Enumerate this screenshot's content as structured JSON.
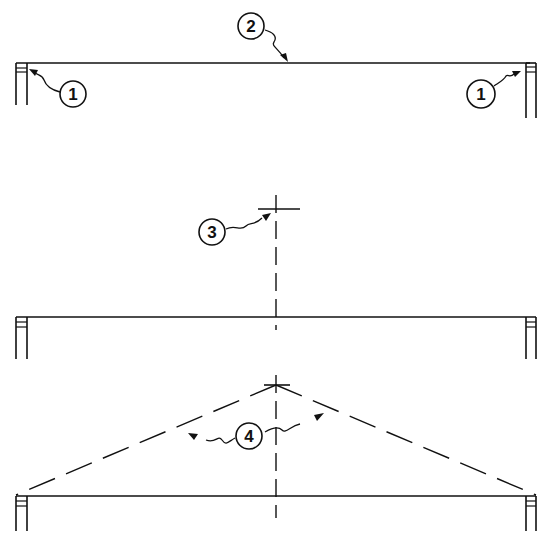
{
  "diagram": {
    "callouts": [
      {
        "id": "1",
        "label": "1",
        "target": "left wall top plate"
      },
      {
        "id": "1b",
        "label": "1",
        "target": "right wall top plate"
      },
      {
        "id": "2",
        "label": "2",
        "target": "beam / span line"
      },
      {
        "id": "3",
        "label": "3",
        "target": "centerline peak mark"
      },
      {
        "id": "4",
        "label": "4",
        "target": "dashed rafter lines to peak"
      }
    ],
    "stages": [
      {
        "name": "stage-1",
        "elements": [
          "left-wall",
          "right-wall",
          "span-line"
        ]
      },
      {
        "name": "stage-2",
        "elements": [
          "left-wall",
          "right-wall",
          "span-line",
          "centerline",
          "peak-cross"
        ]
      },
      {
        "name": "stage-3",
        "elements": [
          "left-wall",
          "right-wall",
          "span-line",
          "centerline",
          "peak-cross",
          "dashed-rafters"
        ]
      }
    ]
  }
}
